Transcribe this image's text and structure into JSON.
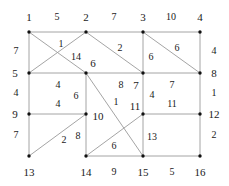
{
  "figure": {
    "type": "weighted-grid-graph",
    "background": "#ffffff",
    "edge_color": "#999999",
    "vertex_color": "#111111",
    "text_color": "#1a1a1a",
    "width": 229,
    "height": 186
  },
  "nodes": [
    {
      "id": "1",
      "x": 29,
      "y": 32,
      "label": "1",
      "label_x": 29,
      "label_y": 17
    },
    {
      "id": "2",
      "x": 86,
      "y": 32,
      "label": "2",
      "label_x": 86,
      "label_y": 17
    },
    {
      "id": "3",
      "x": 143,
      "y": 32,
      "label": "3",
      "label_x": 143,
      "label_y": 17
    },
    {
      "id": "4",
      "x": 200,
      "y": 32,
      "label": "4",
      "label_x": 200,
      "label_y": 17
    },
    {
      "id": "5",
      "x": 29,
      "y": 73,
      "label": "5",
      "label_x": 15,
      "label_y": 73
    },
    {
      "id": "6",
      "x": 86,
      "y": 73,
      "label": "6",
      "label_x": 93,
      "label_y": 63
    },
    {
      "id": "7",
      "x": 143,
      "y": 73,
      "label": "7",
      "label_x": 136,
      "label_y": 85
    },
    {
      "id": "8",
      "x": 200,
      "y": 73,
      "label": "8",
      "label_x": 214,
      "label_y": 73
    },
    {
      "id": "9",
      "x": 29,
      "y": 114,
      "label": "9",
      "label_x": 15,
      "label_y": 114
    },
    {
      "id": "10",
      "x": 86,
      "y": 114,
      "label": "10",
      "label_x": 98,
      "label_y": 116
    },
    {
      "id": "11",
      "x": 143,
      "y": 114,
      "label": "11",
      "label_x": 135,
      "label_y": 106
    },
    {
      "id": "12",
      "x": 200,
      "y": 114,
      "label": "12",
      "label_x": 214,
      "label_y": 114
    },
    {
      "id": "13",
      "x": 29,
      "y": 156,
      "label": "13",
      "label_x": 29,
      "label_y": 172
    },
    {
      "id": "14",
      "x": 86,
      "y": 156,
      "label": "14",
      "label_x": 86,
      "label_y": 172
    },
    {
      "id": "15",
      "x": 143,
      "y": 156,
      "label": "15",
      "label_x": 143,
      "label_y": 172
    },
    {
      "id": "16",
      "x": 200,
      "y": 156,
      "label": "16",
      "label_x": 200,
      "label_y": 172
    }
  ],
  "edges": [
    {
      "from": "1",
      "to": "2",
      "weight": "5",
      "wx": 57,
      "wy": 17
    },
    {
      "from": "2",
      "to": "3",
      "weight": "7",
      "wx": 114,
      "wy": 17
    },
    {
      "from": "3",
      "to": "4",
      "weight": "10",
      "wx": 171,
      "wy": 17
    },
    {
      "from": "1",
      "to": "5",
      "weight": "7",
      "wx": 16,
      "wy": 51
    },
    {
      "from": "5",
      "to": "9",
      "weight": "4",
      "wx": 16,
      "wy": 93
    },
    {
      "from": "9",
      "to": "13",
      "weight": "7",
      "wx": 16,
      "wy": 135
    },
    {
      "from": "4",
      "to": "8",
      "weight": "4",
      "wx": 214,
      "wy": 51
    },
    {
      "from": "8",
      "to": "12",
      "weight": "1",
      "wx": 214,
      "wy": 93
    },
    {
      "from": "12",
      "to": "16",
      "weight": "2",
      "wx": 214,
      "wy": 135
    },
    {
      "from": "5",
      "to": "6",
      "weight": "4",
      "wx": 58,
      "wy": 85
    },
    {
      "from": "6",
      "to": "7",
      "weight": "8",
      "wx": 122,
      "wy": 85
    },
    {
      "from": "7",
      "to": "8",
      "weight": "7",
      "wx": 172,
      "wy": 85
    },
    {
      "from": "5",
      "to": "9",
      "weight": "",
      "wx": 0,
      "wy": 0
    },
    {
      "from": "9",
      "to": "10",
      "weight": "4",
      "wx": 58,
      "wy": 103
    },
    {
      "from": "11",
      "to": "12",
      "weight": "11",
      "wx": 172,
      "wy": 104
    },
    {
      "from": "14",
      "to": "15",
      "weight": "9",
      "wx": 114,
      "wy": 172
    },
    {
      "from": "15",
      "to": "16",
      "weight": "5",
      "wx": 172,
      "wy": 172
    },
    {
      "from": "6",
      "to": "10",
      "weight": "6",
      "wx": 76,
      "wy": 94
    },
    {
      "from": "10",
      "to": "14",
      "weight": "8",
      "wx": 78,
      "wy": 136
    },
    {
      "from": "7",
      "to": "11",
      "weight": "4",
      "wx": 152,
      "wy": 94
    },
    {
      "from": "11",
      "to": "15",
      "weight": "13",
      "wx": 152,
      "wy": 136
    },
    {
      "from": "2",
      "to": "5",
      "weight": "1",
      "wx": 61,
      "wy": 44
    },
    {
      "from": "1",
      "to": "6",
      "weight": "14",
      "wx": 76,
      "wy": 56
    },
    {
      "from": "2",
      "to": "7",
      "weight": "2",
      "wx": 120,
      "wy": 48
    },
    {
      "from": "3",
      "to": "7",
      "weight": "6",
      "wx": 151,
      "wy": 56
    },
    {
      "from": "3",
      "to": "8",
      "weight": "6",
      "wx": 177,
      "wy": 48
    },
    {
      "from": "6",
      "to": "15",
      "weight": "1",
      "wx": 115,
      "wy": 100
    },
    {
      "from": "14",
      "to": "11",
      "weight": "11",
      "wx": 0,
      "wy": 0
    },
    {
      "from": "13",
      "to": "10",
      "weight": "2",
      "wx": 64,
      "wy": 140
    },
    {
      "from": "14",
      "to": "15",
      "weight": "6",
      "wx": 114,
      "wy": 146
    },
    {
      "from": "9",
      "to": "10",
      "weight": "4",
      "wx": 58,
      "wy": 118
    }
  ],
  "edge_labels": [
    {
      "text": "5",
      "x": 57,
      "y": 17
    },
    {
      "text": "7",
      "x": 114,
      "y": 17
    },
    {
      "text": "10",
      "x": 171,
      "y": 17
    },
    {
      "text": "7",
      "x": 16,
      "y": 51
    },
    {
      "text": "4",
      "x": 16,
      "y": 93
    },
    {
      "text": "7",
      "x": 16,
      "y": 135
    },
    {
      "text": "4",
      "x": 214,
      "y": 51
    },
    {
      "text": "1",
      "x": 214,
      "y": 93
    },
    {
      "text": "2",
      "x": 214,
      "y": 135
    },
    {
      "text": "1",
      "x": 61,
      "y": 44
    },
    {
      "text": "14",
      "x": 76,
      "y": 57
    },
    {
      "text": "2",
      "x": 120,
      "y": 48
    },
    {
      "text": "6",
      "x": 151,
      "y": 57
    },
    {
      "text": "6",
      "x": 177,
      "y": 48
    },
    {
      "text": "4",
      "x": 58,
      "y": 85
    },
    {
      "text": "8",
      "x": 121,
      "y": 85
    },
    {
      "text": "7",
      "x": 172,
      "y": 85
    },
    {
      "text": "6",
      "x": 76,
      "y": 96
    },
    {
      "text": "4",
      "x": 58,
      "y": 104
    },
    {
      "text": "1",
      "x": 116,
      "y": 102
    },
    {
      "text": "4",
      "x": 152,
      "y": 95
    },
    {
      "text": "11",
      "x": 172,
      "y": 104
    },
    {
      "text": "8",
      "x": 78,
      "y": 136
    },
    {
      "text": "2",
      "x": 64,
      "y": 140
    },
    {
      "text": "6",
      "x": 114,
      "y": 146
    },
    {
      "text": "13",
      "x": 152,
      "y": 137
    },
    {
      "text": "9",
      "x": 114,
      "y": 172
    },
    {
      "text": "5",
      "x": 172,
      "y": 172
    }
  ]
}
